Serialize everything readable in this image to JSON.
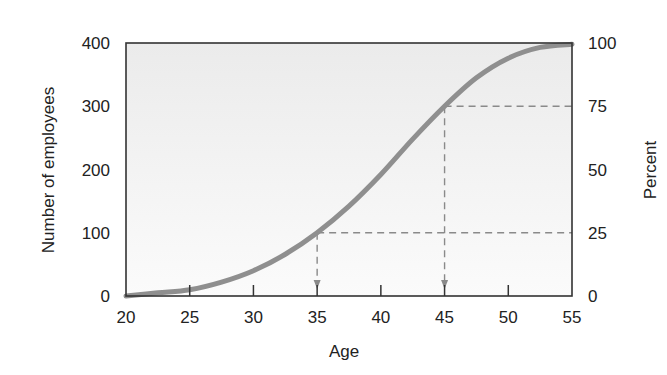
{
  "chart_data": {
    "type": "line",
    "title": "",
    "xlabel": "Age",
    "ylabel": "Number of employees",
    "ylabel_right": "Percent",
    "xlim": [
      20,
      55
    ],
    "ylim": [
      0,
      400
    ],
    "ylim_right": [
      0,
      100
    ],
    "x_ticks": [
      20,
      25,
      30,
      35,
      40,
      45,
      50,
      55
    ],
    "y_ticks": [
      0,
      100,
      200,
      300,
      400
    ],
    "y_ticks_right": [
      0,
      25,
      50,
      75,
      100
    ],
    "grid": false,
    "legend": null,
    "series": [
      {
        "name": "Cumulative employees",
        "x": [
          20,
          22.5,
          25,
          27.5,
          30,
          32.5,
          35,
          37.5,
          40,
          42.5,
          45,
          47.5,
          50,
          52.5,
          55
        ],
        "values": [
          0,
          5,
          10,
          22,
          40,
          66,
          100,
          142,
          192,
          248,
          300,
          345,
          376,
          393,
          398
        ]
      }
    ],
    "annotations": [
      {
        "type": "dashed-guide",
        "from_x": 35,
        "y": 100,
        "percent": 25,
        "arrow_down_at_x": 35
      },
      {
        "type": "dashed-guide",
        "from_x": 45,
        "y": 300,
        "percent": 75,
        "arrow_down_at_x": 45
      }
    ]
  },
  "labels": {
    "xlabel": "Age",
    "ylabel": "Number of employees",
    "ylabel_right": "Percent"
  },
  "colors": {
    "curve": "#8f8f8f",
    "frame": "#333333",
    "guide": "#8a8a8a",
    "plot_bg_top": "#ececec",
    "plot_bg_bottom": "#fafafa"
  }
}
